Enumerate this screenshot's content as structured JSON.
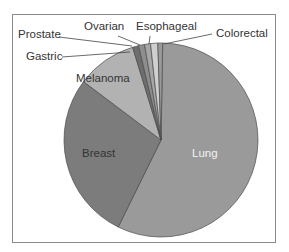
{
  "chart_data": {
    "type": "pie",
    "title": "",
    "categories": [
      "Lung",
      "Breast",
      "Melanoma",
      "Gastric",
      "Prostate",
      "Ovarian",
      "Esophageal",
      "Colorectal"
    ],
    "values": [
      57,
      28,
      10,
      1,
      1,
      1,
      1.2,
      0.8
    ],
    "colors": [
      "#9a9a9a",
      "#7c7c7c",
      "#b2b2b2",
      "#6e6e6e",
      "#8e8e8e",
      "#a6a6a6",
      "#cfcfcf",
      "#999999"
    ],
    "legend": "none",
    "labels_inside": [
      "Lung",
      "Breast",
      "Melanoma"
    ],
    "labels_callout": [
      "Gastric",
      "Prostate",
      "Ovarian",
      "Esophageal",
      "Colorectal"
    ]
  },
  "labels": {
    "lung": "Lung",
    "breast": "Breast",
    "melanoma": "Melanoma",
    "gastric": "Gastric",
    "prostate": "Prostate",
    "ovarian": "Ovarian",
    "esophageal": "Esophageal",
    "colorectal": "Colorectal"
  }
}
